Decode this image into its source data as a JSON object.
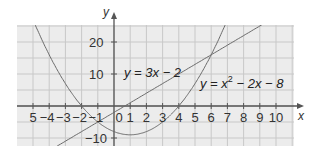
{
  "chart_data": {
    "type": "line",
    "title": "",
    "xlabel": "x",
    "ylabel": "y",
    "xlim": [
      -6,
      11
    ],
    "ylim": [
      -12.5,
      25.3
    ],
    "grid": true,
    "legend_position": "none (inline labels)",
    "x_ticks": [
      "5",
      "-4",
      "-3",
      "-2",
      "-1",
      "0",
      "1",
      "2",
      "3",
      "4",
      "5",
      "6",
      "7",
      "8",
      "9",
      "10"
    ],
    "y_ticks": [
      "20",
      "10",
      "-10"
    ],
    "series": [
      {
        "name": "y = 3x - 2",
        "equation": "y = 3x - 2",
        "x": [
          -3.5,
          0,
          2,
          4,
          6,
          8.4
        ],
        "values": [
          -12.5,
          -2,
          4,
          10,
          16,
          23.2
        ]
      },
      {
        "name": "y = x² - 2x - 8",
        "equation": "y = x^2 - 2x - 8",
        "x": [
          -4.8,
          -4,
          -3,
          -2,
          -1,
          0,
          1,
          2,
          3,
          4,
          5,
          6,
          6.6
        ],
        "values": [
          24.6,
          16,
          7,
          0,
          -5,
          -8,
          -9,
          -8,
          -5,
          0,
          7,
          16,
          22.4
        ]
      }
    ],
    "annotations": [
      {
        "text": "y = 3x − 2",
        "near": [
          1,
          12
        ]
      },
      {
        "text": "y = x² − 2x − 8",
        "near": [
          6,
          6
        ]
      }
    ],
    "intersections": [
      [
        6,
        16
      ],
      [
        -1,
        -5
      ]
    ]
  },
  "labels": {
    "y_axis": "y",
    "x_axis": "x",
    "line_eq_prefix": "y = 3x − 2",
    "parabola_eq": "y = x",
    "parabola_sup": "2",
    "parabola_rest": " − 2x − 8",
    "y20": "20",
    "y10": "10",
    "yneg10": "−10",
    "x_origin": "0"
  },
  "colors": {
    "grid_bg": "#ececec",
    "grid_line": "#c8c8c8",
    "axis": "#555555",
    "curve": "#6a6a6a"
  }
}
